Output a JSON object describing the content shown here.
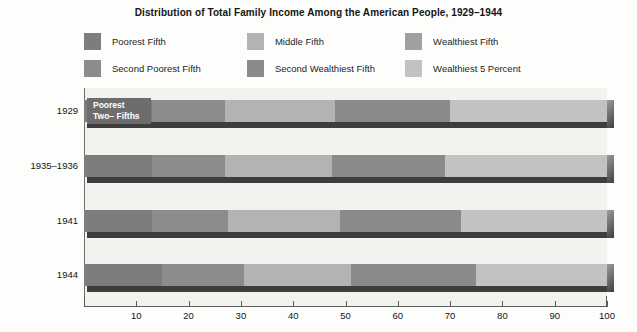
{
  "chart_title": "Distribution of Total Family Income Among the American People, 1929–1944",
  "annotation": {
    "line1": "Poorest",
    "line2": "Two– Fifths"
  },
  "legend": {
    "items": [
      {
        "label": "Poorest Fifth",
        "color": "#7d7d7d"
      },
      {
        "label": "Middle Fifth",
        "color": "#b3b3b3"
      },
      {
        "label": "Wealthiest Fifth",
        "color": "#a0a0a0"
      },
      {
        "label": "Second Poorest Fifth",
        "color": "#8c8c8c"
      },
      {
        "label": "Second Wealthiest Fifth",
        "color": "#8a8a8a"
      },
      {
        "label": "Wealthiest 5 Percent",
        "color": "#c2c2c2"
      }
    ]
  },
  "axis": {
    "ticks": [
      10,
      20,
      30,
      40,
      50,
      60,
      70,
      80,
      90,
      100
    ],
    "min": 0,
    "max": 100
  },
  "chart_data": {
    "type": "bar",
    "orientation": "horizontal",
    "stacked": true,
    "title": "Distribution of Total Family Income Among the American People, 1929–1944",
    "xlabel": "",
    "ylabel": "",
    "xlim": [
      0,
      100
    ],
    "grid": false,
    "legend_position": "top",
    "categories": [
      "1929",
      "1935–1936",
      "1941",
      "1944"
    ],
    "series": [
      {
        "name": "Poorest Fifth",
        "color": "#7d7d7d",
        "values": [
          13.0,
          13.0,
          13.0,
          15.0
        ]
      },
      {
        "name": "Second Poorest Fifth",
        "color": "#8c8c8c",
        "values": [
          14.0,
          14.0,
          14.5,
          15.5
        ]
      },
      {
        "name": "Middle Fifth",
        "color": "#b3b3b3",
        "values": [
          21.0,
          20.5,
          21.5,
          20.5
        ]
      },
      {
        "name": "Second Wealthiest Fifth",
        "color": "#8a8a8a",
        "values": [
          22.0,
          21.5,
          22.5,
          24.0
        ]
      },
      {
        "name": "Wealthiest Fifth",
        "color": "#a0a0a0",
        "values": [
          30.0,
          31.0,
          28.5,
          25.0
        ]
      },
      {
        "name": "Wealthiest 5 Percent",
        "color": "#c2c2c2",
        "values": [
          30.0,
          26.5,
          24.0,
          20.7
        ]
      }
    ]
  },
  "bars": [
    {
      "year": "1929",
      "segments": [
        {
          "name": "Poorest Fifth",
          "start": 0.0,
          "end": 13.0,
          "color": "#7d7d7d"
        },
        {
          "name": "Second Poorest Fifth",
          "start": 13.0,
          "end": 27.0,
          "color": "#8c8c8c"
        },
        {
          "name": "Middle Fifth",
          "start": 27.0,
          "end": 48.0,
          "color": "#b3b3b3"
        },
        {
          "name": "Second Wealthiest Fifth",
          "start": 48.0,
          "end": 70.0,
          "color": "#8a8a8a"
        },
        {
          "name": "Wealthiest 5 Percent",
          "start": 70.0,
          "end": 100.0,
          "color": "#c2c2c2"
        }
      ]
    },
    {
      "year": "1935–1936",
      "segments": [
        {
          "name": "Poorest Fifth",
          "start": 0.0,
          "end": 13.0,
          "color": "#7d7d7d"
        },
        {
          "name": "Second Poorest Fifth",
          "start": 13.0,
          "end": 27.0,
          "color": "#8c8c8c"
        },
        {
          "name": "Middle Fifth",
          "start": 27.0,
          "end": 47.5,
          "color": "#b3b3b3"
        },
        {
          "name": "Second Wealthiest Fifth",
          "start": 47.5,
          "end": 69.0,
          "color": "#8a8a8a"
        },
        {
          "name": "Wealthiest 5 Percent",
          "start": 69.0,
          "end": 100.0,
          "color": "#c2c2c2"
        }
      ]
    },
    {
      "year": "1941",
      "segments": [
        {
          "name": "Poorest Fifth",
          "start": 0.0,
          "end": 13.0,
          "color": "#7d7d7d"
        },
        {
          "name": "Second Poorest Fifth",
          "start": 13.0,
          "end": 27.5,
          "color": "#8c8c8c"
        },
        {
          "name": "Middle Fifth",
          "start": 27.5,
          "end": 49.0,
          "color": "#b3b3b3"
        },
        {
          "name": "Second Wealthiest Fifth",
          "start": 49.0,
          "end": 72.0,
          "color": "#8a8a8a"
        },
        {
          "name": "Wealthiest 5 Percent",
          "start": 72.0,
          "end": 100.0,
          "color": "#c2c2c2"
        }
      ]
    },
    {
      "year": "1944",
      "segments": [
        {
          "name": "Poorest Fifth",
          "start": 0.0,
          "end": 15.0,
          "color": "#7d7d7d"
        },
        {
          "name": "Second Poorest Fifth",
          "start": 15.0,
          "end": 30.5,
          "color": "#8c8c8c"
        },
        {
          "name": "Middle Fifth",
          "start": 30.5,
          "end": 51.0,
          "color": "#b3b3b3"
        },
        {
          "name": "Second Wealthiest Fifth",
          "start": 51.0,
          "end": 75.0,
          "color": "#8a8a8a"
        },
        {
          "name": "Wealthiest 5 Percent",
          "start": 75.0,
          "end": 100.0,
          "color": "#c2c2c2"
        }
      ]
    }
  ]
}
